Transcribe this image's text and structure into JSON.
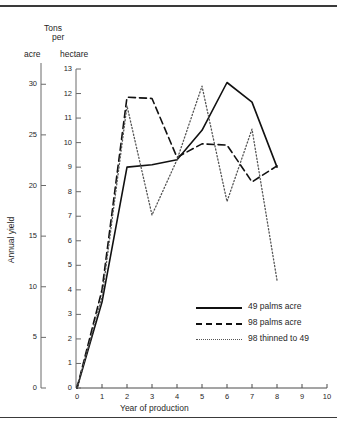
{
  "figure": {
    "unit_header_line1": "Tons",
    "unit_header_line2": "per",
    "left_axis_unit": "acre",
    "right_axis_unit": "hectare",
    "y_axis_label": "Annual yield",
    "x_axis_label": "Year of production"
  },
  "chart_data": {
    "type": "line",
    "title": "Tons per",
    "xlabel": "Year of production",
    "ylabel": "Annual yield",
    "y_unit_primary": "hectare",
    "y_unit_secondary": "acre",
    "x": [
      0,
      1,
      2,
      3,
      4,
      5,
      6,
      7,
      8
    ],
    "xlim": [
      0,
      10
    ],
    "ylim": [
      0,
      13
    ],
    "ylim_acre": [
      0,
      32.1
    ],
    "grid": false,
    "legend_position": "inside-lower-right",
    "x_ticks": [
      "0",
      "1",
      "2",
      "3",
      "4",
      "5",
      "6",
      "7",
      "8",
      "9",
      "10"
    ],
    "y_ticks_hectare": [
      "0",
      "1",
      "2",
      "3",
      "4",
      "5",
      "6",
      "7",
      "8",
      "9",
      "10",
      "11",
      "12",
      "13"
    ],
    "y_ticks_acre": [
      "0",
      "5",
      "10",
      "15",
      "20",
      "25",
      "30"
    ],
    "series": [
      {
        "name": "49 palms acre",
        "style": "solid",
        "color": "#111111",
        "values": [
          0,
          3.5,
          9.0,
          9.1,
          9.3,
          10.5,
          12.45,
          11.65,
          9.0
        ]
      },
      {
        "name": "98 palms acre",
        "style": "dashed",
        "color": "#111111",
        "values": [
          0,
          4.0,
          11.85,
          11.8,
          9.4,
          9.95,
          9.9,
          8.4,
          9.05
        ]
      },
      {
        "name": "98 thinned to 49",
        "style": "dotted",
        "color": "#555555",
        "values": [
          0,
          3.7,
          11.5,
          7.05,
          9.3,
          12.3,
          7.6,
          10.55,
          4.4
        ]
      }
    ]
  },
  "legend": {
    "items": [
      {
        "label": "49 palms acre",
        "style": "solid"
      },
      {
        "label": "98 palms acre",
        "style": "dashed"
      },
      {
        "label": "98 thinned to 49",
        "style": "dotted"
      }
    ]
  }
}
